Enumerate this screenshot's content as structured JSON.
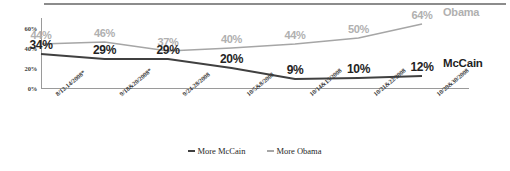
{
  "chart_data": {
    "type": "line",
    "title": "",
    "xlabel": "",
    "ylabel": "",
    "ylim": [
      0,
      70
    ],
    "yticks": [
      "0%",
      "20%",
      "40%",
      "60%"
    ],
    "ytick_values": [
      0,
      20,
      40,
      60
    ],
    "grid": false,
    "legend_position": "bottom-center",
    "categories": [
      "8/12-14/2008*",
      "9/18&20/2008*",
      "9/24-28/2008",
      "10/5&8/2008",
      "10/14&15/2008",
      "10/21&22/2008",
      "10/29&30/2008"
    ],
    "series": [
      {
        "name": "More McCain",
        "end_label": "McCain",
        "color": "#404040",
        "values": [
          34,
          29,
          29,
          20,
          9,
          10,
          12
        ],
        "value_labels": [
          "34%",
          "29%",
          "29%",
          "20%",
          "9%",
          "10%",
          "12%"
        ]
      },
      {
        "name": "More Obama",
        "end_label": "Obama",
        "color": "#a6a6a6",
        "values": [
          44,
          46,
          37,
          40,
          44,
          50,
          64
        ],
        "value_labels": [
          "44%",
          "46%",
          "37%",
          "40%",
          "44%",
          "50%",
          "64%"
        ]
      }
    ]
  },
  "legend": {
    "items": [
      {
        "label": "More McCain"
      },
      {
        "label": "More Obama"
      }
    ]
  }
}
